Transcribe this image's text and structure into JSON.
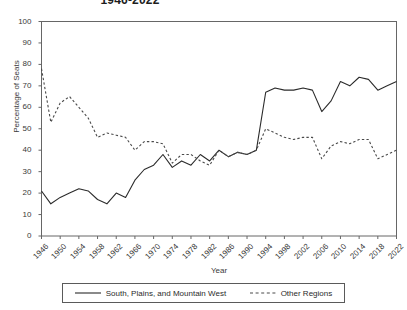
{
  "chart_data": {
    "type": "line",
    "title": "1946-2022",
    "xlabel": "Year",
    "ylabel": "Percentage of Seats",
    "xlim": [
      1946,
      2022
    ],
    "ylim": [
      0,
      100
    ],
    "grid": false,
    "legend_position": "bottom",
    "x": [
      1946,
      1948,
      1950,
      1952,
      1954,
      1956,
      1958,
      1960,
      1962,
      1964,
      1966,
      1968,
      1970,
      1972,
      1974,
      1976,
      1978,
      1980,
      1982,
      1984,
      1986,
      1988,
      1990,
      1992,
      1994,
      1996,
      1998,
      2000,
      2002,
      2004,
      2006,
      2008,
      2010,
      2012,
      2014,
      2016,
      2018,
      2020,
      2022
    ],
    "xticks": [
      1946,
      1950,
      1954,
      1958,
      1962,
      1966,
      1970,
      1974,
      1978,
      1982,
      1986,
      1990,
      1994,
      1998,
      2002,
      2006,
      2010,
      2014,
      2018,
      2022
    ],
    "yticks": [
      0,
      10,
      20,
      30,
      40,
      50,
      60,
      70,
      80,
      90,
      100
    ],
    "series": [
      {
        "name": "South, Plains, and Mountain West",
        "style": "solid",
        "color": "#2b2b2b",
        "values": [
          21,
          15,
          18,
          20,
          22,
          21,
          17,
          15,
          20,
          18,
          26,
          31,
          33,
          38,
          32,
          35,
          33,
          38,
          35,
          40,
          37,
          39,
          38,
          40,
          67,
          69,
          68,
          68,
          69,
          68,
          58,
          63,
          72,
          70,
          74,
          73,
          68,
          70,
          72
        ]
      },
      {
        "name": "Other Regions",
        "style": "dashed",
        "color": "#4a4a4a",
        "values": [
          78,
          53,
          62,
          65,
          60,
          55,
          46,
          48,
          47,
          46,
          40,
          44,
          44,
          43,
          34,
          38,
          38,
          35,
          33,
          40,
          37,
          39,
          38,
          40,
          50,
          48,
          46,
          45,
          46,
          46,
          36,
          42,
          44,
          43,
          45,
          45,
          36,
          38,
          40
        ]
      }
    ]
  },
  "axes": {
    "y_title": "Percentage of Seats",
    "x_title": "Year"
  },
  "legend": {
    "items": [
      {
        "label": "South, Plains, and Mountain West",
        "style": "solid"
      },
      {
        "label": "Other Regions",
        "style": "dashed"
      }
    ]
  }
}
